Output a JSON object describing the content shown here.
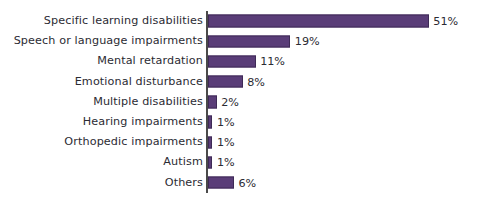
{
  "chart_data": {
    "type": "bar",
    "orientation": "horizontal",
    "title": "",
    "subtitle": "",
    "xlabel": "",
    "ylabel": "",
    "xlim": [
      0,
      51
    ],
    "grid": false,
    "legend": false,
    "value_suffix": "%",
    "categories": [
      "Specific learning disabilities",
      "Speech or language impairments",
      "Mental retardation",
      "Emotional disturbance",
      "Multiple disabilities",
      "Hearing impairments",
      "Orthopedic impairments",
      "Autism",
      "Others"
    ],
    "values": [
      51,
      19,
      11,
      8,
      2,
      1,
      1,
      1,
      6
    ],
    "value_labels": [
      "51%",
      "19%",
      "11%",
      "8%",
      "2%",
      "1%",
      "1%",
      "1%",
      "6%"
    ],
    "bars": [
      {
        "label": "Specific learning disabilities",
        "value": 51,
        "value_label": "51%"
      },
      {
        "label": "Speech or language impairments",
        "value": 19,
        "value_label": "19%"
      },
      {
        "label": "Mental retardation",
        "value": 11,
        "value_label": "11%"
      },
      {
        "label": "Emotional disturbance",
        "value": 8,
        "value_label": "8%"
      },
      {
        "label": "Multiple disabilities",
        "value": 2,
        "value_label": "2%"
      },
      {
        "label": "Hearing impairments",
        "value": 1,
        "value_label": "1%"
      },
      {
        "label": "Orthopedic impairments",
        "value": 1,
        "value_label": "1%"
      },
      {
        "label": "Autism",
        "value": 1,
        "value_label": "1%"
      },
      {
        "label": "Others",
        "value": 6,
        "value_label": "6%"
      }
    ]
  },
  "style": {
    "bar_fill": "#5a3d78",
    "bar_stroke": "#3e2a56",
    "text_color": "#2b2b33",
    "axis_color": "#4a4a4a",
    "background": "#ffffff"
  },
  "layout": {
    "px_per_percent": 4.33,
    "bar_origin_x": 208,
    "row_height": 20.2,
    "min_bar_width": 4.4
  }
}
